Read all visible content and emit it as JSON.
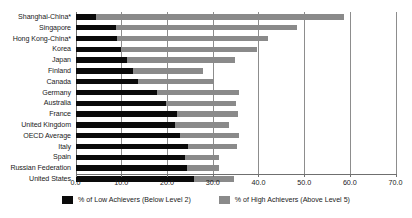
{
  "chart_data": {
    "type": "bar",
    "title": "",
    "subtitle": "",
    "xlabel": "",
    "ylabel": "",
    "orientation": "horizontal",
    "stacked": true,
    "grid": true,
    "legend_position": "bottom",
    "xlim": [
      0.0,
      70.0
    ],
    "xticks": [
      "0.0",
      "10.0",
      "20.0",
      "30.0",
      "40.0",
      "50.0",
      "60.0",
      "70.0"
    ],
    "xtick_values": [
      0,
      10,
      20,
      30,
      40,
      50,
      60,
      70
    ],
    "categories": [
      "Shanghai-China*",
      "Singapore",
      "Hong Kong-China*",
      "Korea",
      "Japan",
      "Finland",
      "Canada",
      "Germany",
      "Australia",
      "France",
      "United Kingdom",
      "OECD Average",
      "Italy",
      "Spain",
      "Russian Federation",
      "United States"
    ],
    "series": [
      {
        "name": "% of Low Achievers (Below Level 2)",
        "color": "#0a0a0a",
        "values": [
          4.5,
          8.8,
          9.0,
          9.9,
          11.2,
          12.5,
          13.7,
          17.8,
          19.8,
          22.2,
          21.8,
          22.9,
          24.5,
          24.0,
          24.4,
          26.0
        ]
      },
      {
        "name": "% of High Achievers (Above Level 5)",
        "color": "#8a8a8a",
        "values": [
          54.2,
          39.6,
          33.0,
          29.8,
          23.7,
          15.4,
          16.6,
          18.0,
          15.2,
          13.4,
          11.8,
          12.9,
          10.8,
          7.4,
          7.0,
          8.7
        ]
      }
    ],
    "totals": [
      58.7,
      48.4,
      42.0,
      39.7,
      34.9,
      27.9,
      30.3,
      35.8,
      35.0,
      35.6,
      33.6,
      35.8,
      35.3,
      31.4,
      31.4,
      34.7
    ]
  },
  "legend": {
    "items": [
      {
        "label": "% of Low Achievers (Below Level 2)",
        "color": "#0a0a0a"
      },
      {
        "label": "% of High Achievers (Above Level 5)",
        "color": "#8a8a8a"
      }
    ]
  }
}
